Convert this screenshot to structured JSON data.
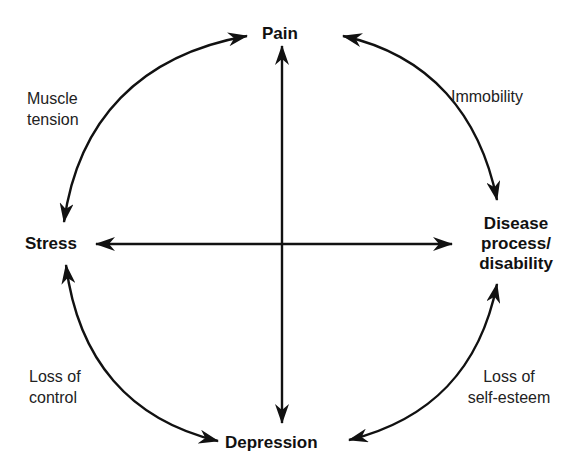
{
  "diagram": {
    "type": "cycle",
    "nodes": {
      "pain": "Pain",
      "disease": [
        "Disease",
        "process/",
        "disability"
      ],
      "depression": "Depression",
      "stress": "Stress"
    },
    "edge_labels": {
      "pain_to_disease": "Immobility",
      "disease_to_depression": [
        "Loss of",
        "self-esteem"
      ],
      "stress_to_depression": [
        "Loss of",
        "control"
      ],
      "pain_to_stress": [
        "Muscle",
        "tension"
      ]
    },
    "edges": [
      {
        "from": "Pain",
        "to": "Disease process/disability",
        "label": "Immobility",
        "bidirectional": true
      },
      {
        "from": "Disease process/disability",
        "to": "Depression",
        "label": "Loss of self-esteem",
        "bidirectional": true
      },
      {
        "from": "Depression",
        "to": "Stress",
        "label": "Loss of control",
        "bidirectional": true
      },
      {
        "from": "Stress",
        "to": "Pain",
        "label": "Muscle tension",
        "bidirectional": true
      },
      {
        "from": "Pain",
        "to": "Depression",
        "label": "",
        "bidirectional": true
      },
      {
        "from": "Stress",
        "to": "Disease process/disability",
        "label": "",
        "bidirectional": true
      }
    ]
  }
}
